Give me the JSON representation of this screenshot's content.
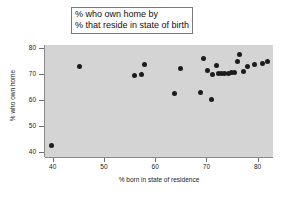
{
  "chart_data": {
    "type": "scatter",
    "title": "% who own home by % that reside in state of birth",
    "title_lines": [
      "% who own home by",
      "% that reside in state of birth"
    ],
    "xlabel": "% born in state of residence",
    "ylabel": "% who own home",
    "xlim": [
      38.5,
      83.0
    ],
    "ylim": [
      38.0,
      81.0
    ],
    "xticks": [
      40,
      50,
      60,
      70,
      80
    ],
    "xtick_labels": [
      "40",
      "50",
      "60",
      "70",
      "80"
    ],
    "yticks": [
      40,
      50,
      60,
      70,
      80
    ],
    "ytick_labels": [
      "40",
      "50",
      "60",
      "70",
      "80"
    ],
    "grid": false,
    "legend": null,
    "marker": "circle",
    "marker_color": "#1c1c1c",
    "plot_background": "#d4d4d4",
    "figure_background": "#ffffff",
    "n_points": 26,
    "points": [
      {
        "x": 39.8,
        "y": 42.5
      },
      {
        "x": 45.3,
        "y": 72.8
      },
      {
        "x": 55.9,
        "y": 69.1
      },
      {
        "x": 57.3,
        "y": 69.7
      },
      {
        "x": 57.9,
        "y": 73.5
      },
      {
        "x": 63.8,
        "y": 62.3
      },
      {
        "x": 64.9,
        "y": 71.9
      },
      {
        "x": 68.8,
        "y": 62.9
      },
      {
        "x": 69.4,
        "y": 75.9
      },
      {
        "x": 70.3,
        "y": 71.4
      },
      {
        "x": 70.9,
        "y": 60.1
      },
      {
        "x": 71.2,
        "y": 69.7
      },
      {
        "x": 71.9,
        "y": 73.2
      },
      {
        "x": 72.3,
        "y": 70.1
      },
      {
        "x": 72.9,
        "y": 70.1
      },
      {
        "x": 74.3,
        "y": 70.0
      },
      {
        "x": 74.9,
        "y": 70.3
      },
      {
        "x": 75.5,
        "y": 70.6
      },
      {
        "x": 76.0,
        "y": 74.8
      },
      {
        "x": 76.5,
        "y": 77.5
      },
      {
        "x": 77.2,
        "y": 70.7
      },
      {
        "x": 78.0,
        "y": 72.6
      },
      {
        "x": 79.3,
        "y": 73.5
      },
      {
        "x": 81.0,
        "y": 74.0
      },
      {
        "x": 81.9,
        "y": 74.7
      },
      {
        "x": 73.6,
        "y": 70.0
      }
    ]
  }
}
